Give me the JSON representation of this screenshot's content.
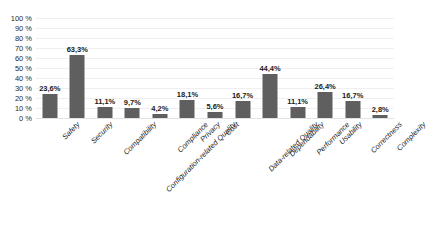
{
  "chart_data": {
    "type": "bar",
    "title": "",
    "subtitle": "",
    "xlabel": "",
    "ylabel": "",
    "ylim": [
      0,
      100
    ],
    "ytick_labels": [
      "100 %",
      "90 %",
      "80 %",
      "70 %",
      "60 %",
      "50 %",
      "40 %",
      "30 %",
      "20 %",
      "10 %",
      "0 %"
    ],
    "ytick_values": [
      100,
      90,
      80,
      70,
      60,
      50,
      40,
      30,
      20,
      10,
      0
    ],
    "grid": true,
    "legend": false,
    "legend_position": "none",
    "bar_color": "#5f5f5f",
    "categories": [
      "Safety",
      "Security",
      "Compatibility",
      "Configuration-related Quality",
      "Compliance",
      "Privacy",
      "Cost",
      "Data-related Quality",
      "Dependability",
      "Performance",
      "Usability",
      "Correctness",
      "Complexity"
    ],
    "values": [
      23.6,
      63.3,
      11.1,
      9.7,
      4.2,
      18.1,
      5.6,
      16.7,
      44.4,
      11.1,
      26.4,
      16.7,
      2.8
    ],
    "value_labels": [
      "23,6%",
      "63,3%",
      "11,1%",
      "9,7%",
      "4,2%",
      "18,1%",
      "5,6%",
      "16,7%",
      "44,4%",
      "11,1%",
      "26,4%",
      "16,7%",
      "2,8%"
    ]
  }
}
